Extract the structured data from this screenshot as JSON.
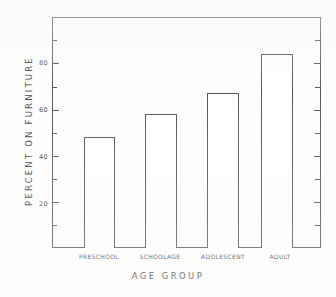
{
  "chart_data": {
    "type": "bar",
    "title": "",
    "subtitle": "",
    "xlabel": "AGE GROUP",
    "ylabel": "PERCENT ON FURNITURE",
    "categories": [
      "PRESCHOOL",
      "SCHOOLAGE",
      "ADOLESCENT",
      "ADULT"
    ],
    "values": [
      48,
      58,
      67,
      84
    ],
    "ylim": [
      0,
      100
    ],
    "xlim": [
      0,
      4
    ],
    "ytick_labels": [
      "20",
      "40",
      "60",
      "80"
    ],
    "ytick_values": [
      20,
      40,
      60,
      80
    ],
    "yminor_values": [
      10,
      30,
      50,
      70,
      90
    ],
    "grid": false,
    "legend": null,
    "legend_position": "none",
    "series": [
      {
        "name": "Percent on furniture",
        "values": [
          48,
          58,
          67,
          84
        ]
      }
    ],
    "bar_style": {
      "fill": "#ffffff",
      "edge": "#3a3a3a"
    },
    "annotations": []
  },
  "figure": {
    "background": "#fefefe",
    "axis_color": "#3c3c3c",
    "text_color": "#242424"
  }
}
